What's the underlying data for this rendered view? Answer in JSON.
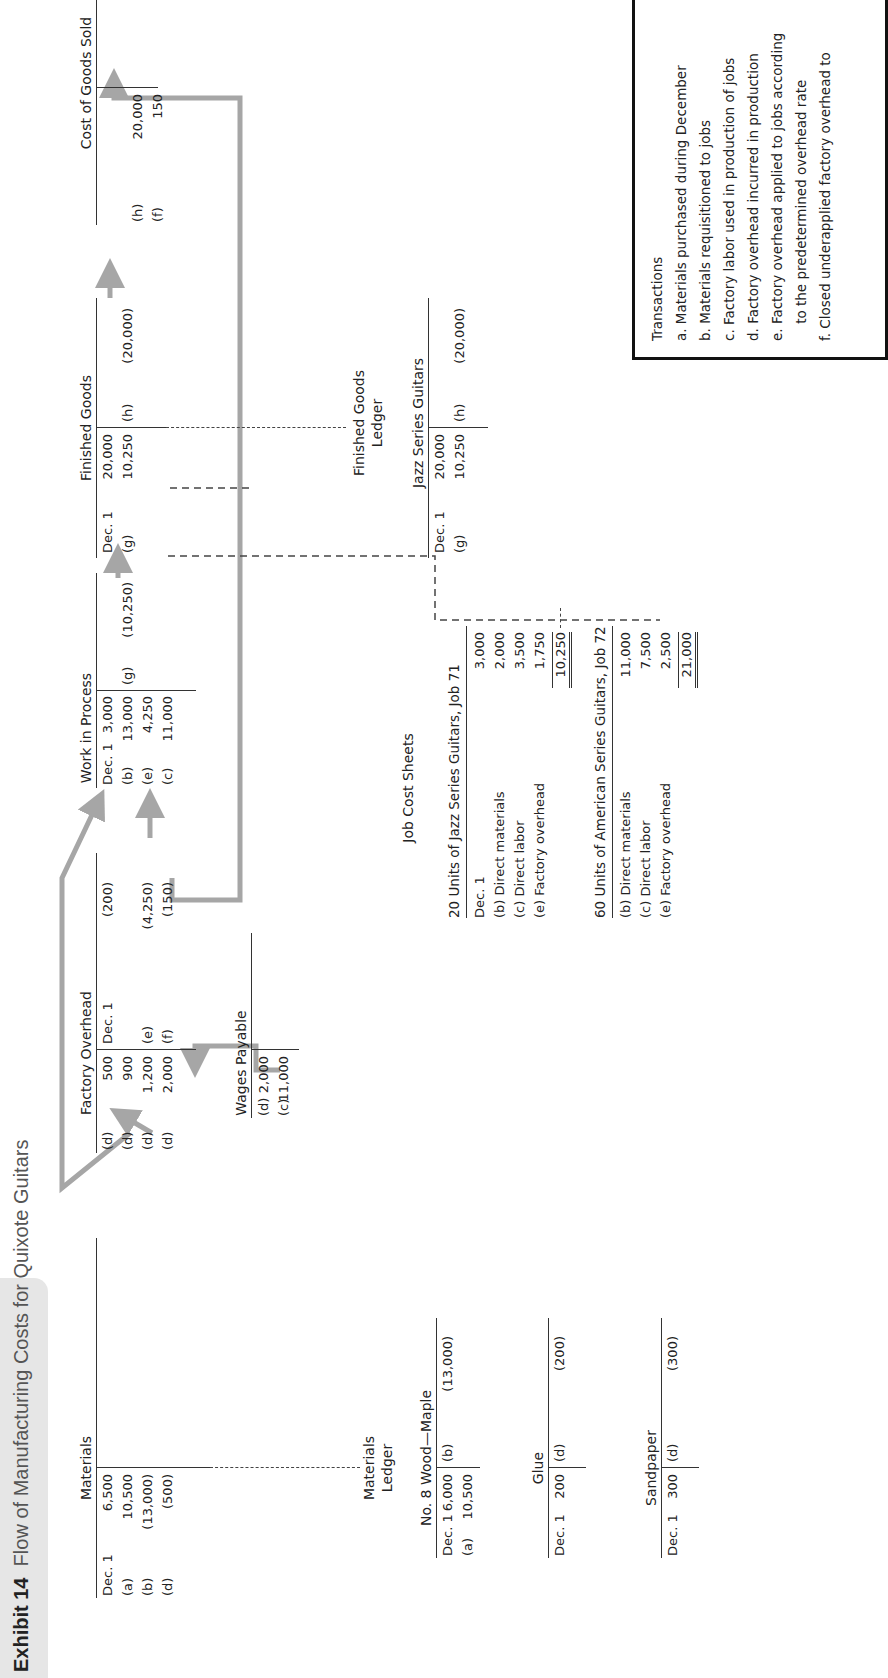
{
  "title": {
    "exhibit": "Exhibit 14",
    "text": "Flow of Manufacturing Costs for Quixote Guitars"
  },
  "accounts": {
    "materials": {
      "title": "Materials",
      "debits": [
        {
          "ref": "Dec. 1",
          "amount": "6,500"
        },
        {
          "ref": "(a)",
          "amount": "10,500"
        },
        {
          "ref": "(b)",
          "amount": "(13,000)"
        },
        {
          "ref": "(d)",
          "amount": "(500)"
        }
      ]
    },
    "factory_overhead": {
      "title": "Factory Overhead",
      "debits": [
        {
          "ref": "(d)",
          "amount": "500"
        },
        {
          "ref": "(d)",
          "amount": "900"
        },
        {
          "ref": "(d)",
          "amount": "1,200"
        },
        {
          "ref": "(d)",
          "amount": "2,000"
        }
      ],
      "credits": [
        {
          "ref": "Dec. 1",
          "amount": "(200)"
        },
        {
          "ref": "",
          "amount": ""
        },
        {
          "ref": "(e)",
          "amount": "(4,250)"
        },
        {
          "ref": "(f)",
          "amount": "(150)"
        }
      ]
    },
    "wages_payable": {
      "title": "Wages Payable",
      "debits": [
        {
          "ref": "(d)",
          "amount": "2,000"
        },
        {
          "ref": "(c)",
          "amount": "11,000"
        }
      ]
    },
    "work_in_process": {
      "title": "Work in Process",
      "debits": [
        {
          "ref": "Dec. 1",
          "amount": "3,000"
        },
        {
          "ref": "(b)",
          "amount": "13,000"
        },
        {
          "ref": "(e)",
          "amount": "4,250"
        },
        {
          "ref": "(c)",
          "amount": "11,000"
        }
      ],
      "credits": [
        {
          "ref": "(g)",
          "amount": "(10,250)"
        }
      ]
    },
    "finished_goods": {
      "title": "Finished Goods",
      "debits": [
        {
          "ref": "Dec. 1",
          "amount": "20,000"
        },
        {
          "ref": "(g)",
          "amount": "10,250"
        }
      ],
      "credits": [
        {
          "ref": "(h)",
          "amount": "(20,000)"
        }
      ]
    },
    "cost_of_goods_sold": {
      "title": "Cost of Goods Sold",
      "debits": [
        {
          "ref": "(h)",
          "amount": "20,000"
        },
        {
          "ref": "(f)",
          "amount": "150"
        }
      ]
    }
  },
  "materials_ledger": {
    "label_line1": "Materials",
    "label_line2": "Ledger",
    "accounts": [
      {
        "title": "No. 8 Wood—Maple",
        "debits": [
          {
            "ref": "Dec. 1",
            "amount": "6,000"
          },
          {
            "ref": "(a)",
            "amount": "10,500"
          }
        ],
        "credits": [
          {
            "ref": "(b)",
            "amount": "(13,000)"
          }
        ]
      },
      {
        "title": "Glue",
        "debits": [
          {
            "ref": "Dec. 1",
            "amount": "200"
          }
        ],
        "credits": [
          {
            "ref": "(d)",
            "amount": "(200)"
          }
        ]
      },
      {
        "title": "Sandpaper",
        "debits": [
          {
            "ref": "Dec. 1",
            "amount": "300"
          }
        ],
        "credits": [
          {
            "ref": "(d)",
            "amount": "(300)"
          }
        ]
      }
    ]
  },
  "job_cost_sheets": {
    "label": "Job Cost Sheets",
    "jobs": [
      {
        "title": "20 Units of Jazz Series Guitars, Job 71",
        "rows": [
          {
            "label": "Dec. 1",
            "amount": "3,000"
          },
          {
            "label": "(b) Direct materials",
            "amount": "2,000"
          },
          {
            "label": "(c) Direct labor",
            "amount": "3,500"
          },
          {
            "label": "(e) Factory overhead",
            "amount": "1,750"
          }
        ],
        "total": "10,250"
      },
      {
        "title": "60 Units of American Series Guitars, Job 72",
        "rows": [
          {
            "label": "(b) Direct materials",
            "amount": "11,000"
          },
          {
            "label": "(c) Direct labor",
            "amount": "7,500"
          },
          {
            "label": "(e) Factory overhead",
            "amount": "2,500"
          }
        ],
        "total": "21,000"
      }
    ]
  },
  "finished_goods_ledger": {
    "label_line1": "Finished Goods",
    "label_line2": "Ledger",
    "account": {
      "title": "Jazz Series Guitars",
      "debits": [
        {
          "ref": "Dec. 1",
          "amount": "20,000"
        },
        {
          "ref": "(g)",
          "amount": "10,250"
        }
      ],
      "credits": [
        {
          "ref": "(h)",
          "amount": "(20,000)"
        }
      ]
    }
  },
  "transactions": {
    "heading": "Transactions",
    "items": [
      "a. Materials purchased during December",
      "b. Materials requisitioned to jobs",
      "c. Factory labor used in production of jobs",
      "d. Factory overhead incurred in production",
      "e. Factory overhead applied to jobs according",
      "    to the predetermined overhead rate",
      "f. Closed underapplied factory overhead to"
    ]
  },
  "colors": {
    "arrow": "#a6a6a6",
    "line": "#333333",
    "title_bg": "#e6e6e6"
  }
}
